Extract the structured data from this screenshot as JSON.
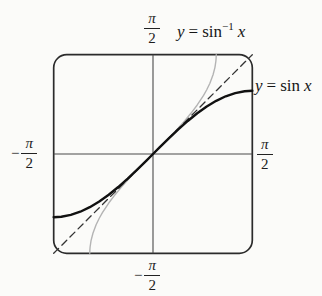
{
  "ticks": {
    "top": {
      "sign": "",
      "num": "π",
      "den": "2",
      "display": "π/2",
      "axis": "y",
      "value": 1.5708
    },
    "left": {
      "sign": "−",
      "num": "π",
      "den": "2",
      "display": "−π/2",
      "axis": "x",
      "value": -1.5708
    },
    "right": {
      "sign": "",
      "num": "π",
      "den": "2",
      "display": "π/2",
      "axis": "x",
      "value": 1.5708
    },
    "bottom": {
      "sign": "−",
      "num": "π",
      "den": "2",
      "display": "−π/2",
      "axis": "y",
      "value": -1.5708
    }
  },
  "labels": {
    "arcsin": {
      "y": "y",
      "eq": "=",
      "fn": "sin",
      "exp": "−1",
      "arg": "x",
      "display": "y = sin⁻¹ x"
    },
    "sin": {
      "y": "y",
      "eq": "=",
      "fn": "sin",
      "arg": "x",
      "display": "y = sin x"
    }
  },
  "chart_data": {
    "type": "line",
    "xlabel": "x",
    "ylabel": "y",
    "xlim": [
      -1.5708,
      1.5708
    ],
    "ylim": [
      -1.5708,
      1.5708
    ],
    "grid": false,
    "legend_position": "labels-on-plot",
    "x_ticks": [
      {
        "value": -1.5708,
        "label": "−π/2"
      },
      {
        "value": 1.5708,
        "label": "π/2"
      }
    ],
    "y_ticks": [
      {
        "value": -1.5708,
        "label": "−π/2"
      },
      {
        "value": 1.5708,
        "label": "π/2"
      }
    ],
    "frame": {
      "stroke": "#2b2b2b",
      "stroke_width": 1.7,
      "corner_radius": 13
    },
    "axes": {
      "stroke": "#4a4a4a",
      "stroke_width": 1.1
    },
    "series": [
      {
        "id": "arcsin-curve",
        "name": "y = sin⁻¹ x",
        "color": "#b4b4b4",
        "width": 1.4,
        "style": "solid",
        "dash": "",
        "points": [
          [
            -1,
            -1.5708
          ],
          [
            -0.999,
            -1.5261
          ],
          [
            -0.995,
            -1.4709
          ],
          [
            -0.98,
            -1.3705
          ],
          [
            -0.95,
            -1.2532
          ],
          [
            -0.9,
            -1.1198
          ],
          [
            -0.85,
            -1.016
          ],
          [
            -0.8,
            -0.9273
          ],
          [
            -0.7,
            -0.7754
          ],
          [
            -0.6,
            -0.6435
          ],
          [
            -0.5,
            -0.5236
          ],
          [
            -0.4,
            -0.4115
          ],
          [
            -0.3,
            -0.3047
          ],
          [
            -0.2,
            -0.2014
          ],
          [
            -0.1,
            -0.1002
          ],
          [
            0,
            0
          ],
          [
            0.1,
            0.1002
          ],
          [
            0.2,
            0.2014
          ],
          [
            0.3,
            0.3047
          ],
          [
            0.4,
            0.4115
          ],
          [
            0.5,
            0.5236
          ],
          [
            0.6,
            0.6435
          ],
          [
            0.7,
            0.7754
          ],
          [
            0.8,
            0.9273
          ],
          [
            0.85,
            1.016
          ],
          [
            0.9,
            1.1198
          ],
          [
            0.95,
            1.2532
          ],
          [
            0.98,
            1.3705
          ],
          [
            0.995,
            1.4709
          ],
          [
            0.999,
            1.5261
          ],
          [
            1,
            1.5708
          ]
        ]
      },
      {
        "id": "identity-line",
        "name": "y = x",
        "color": "#333333",
        "width": 1.3,
        "style": "dashed",
        "dash": "7,4.5",
        "points": [
          [
            -1.5708,
            -1.5708
          ],
          [
            1.5708,
            1.5708
          ]
        ]
      },
      {
        "id": "sin-curve",
        "name": "y = sin x",
        "color": "#111111",
        "width": 2.4,
        "style": "solid",
        "dash": "",
        "points": [
          [
            -1.5708,
            -1
          ],
          [
            -1.45,
            -0.9927
          ],
          [
            -1.3,
            -0.9636
          ],
          [
            -1.15,
            -0.9128
          ],
          [
            -1,
            -0.8415
          ],
          [
            -0.85,
            -0.7513
          ],
          [
            -0.7,
            -0.6442
          ],
          [
            -0.55,
            -0.5227
          ],
          [
            -0.4,
            -0.3894
          ],
          [
            -0.25,
            -0.2474
          ],
          [
            -0.1,
            -0.0998
          ],
          [
            0,
            0
          ],
          [
            0.1,
            0.0998
          ],
          [
            0.25,
            0.2474
          ],
          [
            0.4,
            0.3894
          ],
          [
            0.55,
            0.5227
          ],
          [
            0.7,
            0.6442
          ],
          [
            0.85,
            0.7513
          ],
          [
            1,
            0.8415
          ],
          [
            1.15,
            0.9128
          ],
          [
            1.3,
            0.9636
          ],
          [
            1.45,
            0.9927
          ],
          [
            1.5708,
            1
          ]
        ]
      }
    ]
  }
}
